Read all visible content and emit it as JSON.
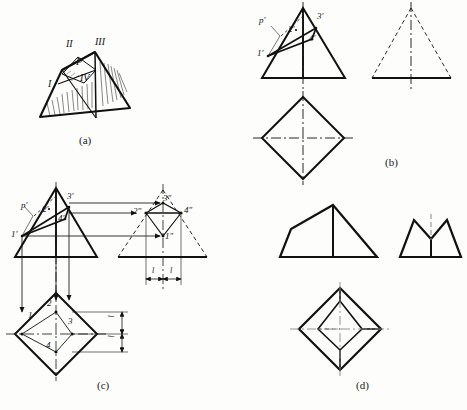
{
  "figure": {
    "title_captions": [
      {
        "id": "cap-a",
        "text": "(a)",
        "x": 79,
        "y": 134
      },
      {
        "id": "cap-b",
        "text": "(b)",
        "x": 385,
        "y": 156
      },
      {
        "id": "cap-c",
        "text": "(c)",
        "x": 97,
        "y": 379
      },
      {
        "id": "cap-d",
        "text": "(d)",
        "x": 356,
        "y": 379
      }
    ],
    "panel_a": {
      "name": "pictorial-pyramid",
      "labels": [
        {
          "text": "II",
          "x": 66,
          "y": 44
        },
        {
          "text": "III",
          "x": 95,
          "y": 42
        },
        {
          "text": "P",
          "x": 78,
          "y": 62
        },
        {
          "text": "IV",
          "x": 81,
          "y": 78
        },
        {
          "text": "I",
          "x": 49,
          "y": 84
        }
      ]
    },
    "panel_b": {
      "name": "step-one-projections",
      "front_view_labels": [
        {
          "text": "p′",
          "x": 264,
          "y": 21
        },
        {
          "text": "2′",
          "x": 291,
          "y": 30
        },
        {
          "text": "3′",
          "x": 318,
          "y": 17
        },
        {
          "text": "4′",
          "x": 311,
          "y": 39
        },
        {
          "text": "1′",
          "x": 262,
          "y": 54
        }
      ]
    },
    "panel_c": {
      "name": "step-two-projections",
      "front_view_labels": [
        {
          "text": "p′",
          "x": 26,
          "y": 210
        },
        {
          "text": "2′",
          "x": 49,
          "y": 214
        },
        {
          "text": "3′",
          "x": 69,
          "y": 197
        },
        {
          "text": "4′",
          "x": 58,
          "y": 224
        },
        {
          "text": "1′",
          "x": 16,
          "y": 240
        }
      ],
      "side_view_labels": [
        {
          "text": "3″",
          "x": 163,
          "y": 199
        },
        {
          "text": "2″",
          "x": 138,
          "y": 214
        },
        {
          "text": "4″",
          "x": 185,
          "y": 212
        },
        {
          "text": "1″",
          "x": 164,
          "y": 239
        }
      ],
      "top_view_labels": [
        {
          "text": "1",
          "x": 32,
          "y": 316
        },
        {
          "text": "2",
          "x": 49,
          "y": 303
        },
        {
          "text": "3",
          "x": 71,
          "y": 320
        },
        {
          "text": "4",
          "x": 48,
          "y": 345
        }
      ],
      "dimension_labels": [
        {
          "text": "l",
          "x": 156,
          "y": 272
        },
        {
          "text": "l",
          "x": 174,
          "y": 272
        },
        {
          "text": "l",
          "x": 113,
          "y": 313
        },
        {
          "text": "l",
          "x": 113,
          "y": 331
        }
      ]
    },
    "panel_d": {
      "name": "final-result-projections"
    }
  },
  "colors": {
    "ink": "#111111",
    "paper": "#fdfdfb",
    "thin": "#333333"
  }
}
